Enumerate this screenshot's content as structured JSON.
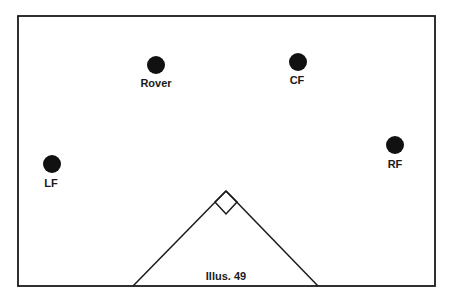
{
  "diagram": {
    "caption": "Illus. 49",
    "players": [
      {
        "id": "rover",
        "label": "Rover"
      },
      {
        "id": "cf",
        "label": "CF"
      },
      {
        "id": "lf",
        "label": "LF"
      },
      {
        "id": "rf",
        "label": "RF"
      }
    ],
    "colors": {
      "ink": "#1a1a1a",
      "paper": "#ffffff"
    }
  }
}
